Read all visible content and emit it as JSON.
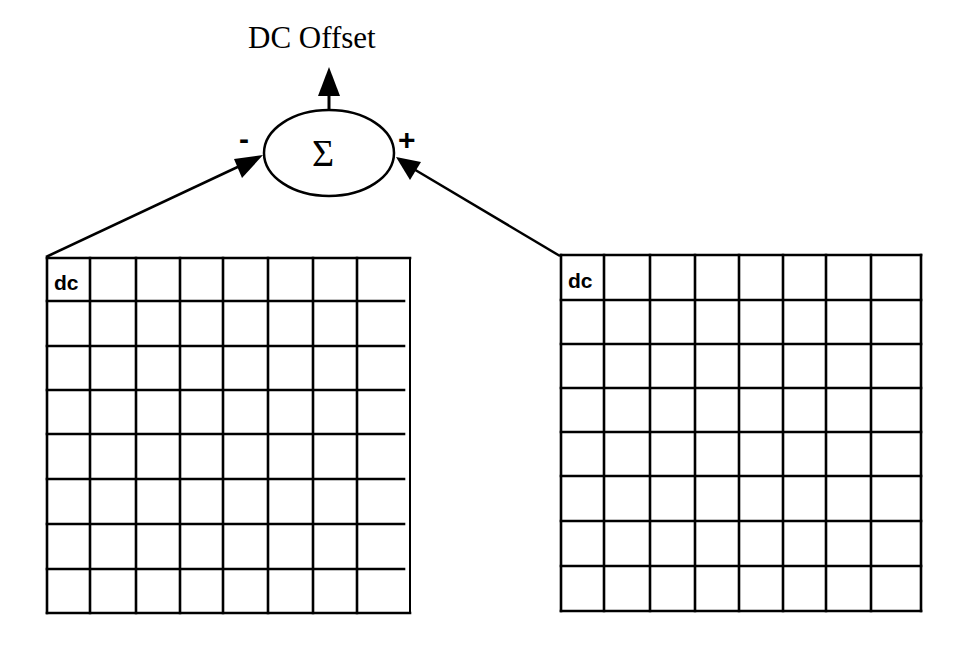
{
  "diagram": {
    "output_label": "DC Offset",
    "summation_symbol": "Σ",
    "inputs": {
      "left_sign": "-",
      "right_sign": "+"
    },
    "grids": [
      {
        "id": "left",
        "rows": 8,
        "cols": 8,
        "corner_label": "dc",
        "sign": "-",
        "col_x": [
          47,
          90,
          136,
          180,
          223,
          268,
          313,
          357,
          410
        ],
        "row_y": [
          258,
          301,
          346,
          390,
          434,
          479,
          524,
          569,
          613
        ],
        "note": "horizontal interior lines stop short of right border"
      },
      {
        "id": "right",
        "rows": 8,
        "cols": 8,
        "corner_label": "dc",
        "sign": "+",
        "col_x": [
          561,
          604,
          650,
          695,
          739,
          783,
          826,
          871,
          921
        ],
        "row_y": [
          255,
          300,
          344,
          388,
          432,
          476,
          521,
          566,
          611
        ]
      }
    ],
    "colors": {
      "stroke": "#000000",
      "background": "#ffffff"
    }
  }
}
